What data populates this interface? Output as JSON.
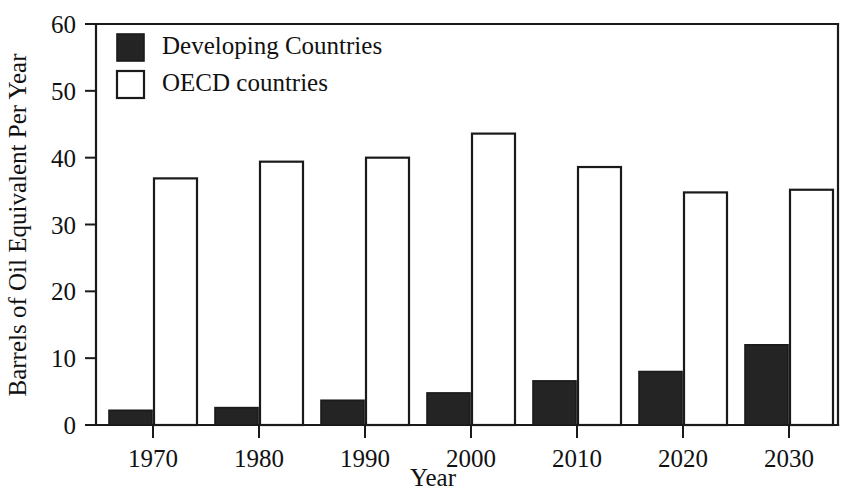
{
  "chart_data": {
    "type": "bar",
    "title": "",
    "xlabel": "Year",
    "ylabel": "Barrels of Oil Equivalent Per Year",
    "categories": [
      "1970",
      "1980",
      "1990",
      "2000",
      "2010",
      "2020",
      "2030"
    ],
    "series": [
      {
        "name": "Developing Countries",
        "color": "#242424",
        "style": "filled",
        "values": [
          2.2,
          2.6,
          3.7,
          4.8,
          6.6,
          8.0,
          12.0
        ]
      },
      {
        "name": "OECD countries",
        "color": "#ffffff",
        "style": "outlined",
        "values": [
          36.9,
          39.4,
          40.0,
          43.6,
          38.6,
          34.8,
          35.2
        ]
      }
    ],
    "ylim": [
      0,
      60
    ],
    "yticks": [
      0,
      10,
      20,
      30,
      40,
      50,
      60
    ],
    "ytick_labels": [
      "0",
      "10",
      "20",
      "30",
      "40",
      "50",
      "60"
    ],
    "xtick_labels": [
      "1970",
      "1980",
      "1990",
      "2000",
      "2010",
      "2020",
      "2030"
    ],
    "grid": false,
    "legend_position": "top-left",
    "frame": "left-top-bottom"
  },
  "legend": {
    "entries": [
      {
        "label": "Developing Countries",
        "swatch": "dark"
      },
      {
        "label": "OECD countries",
        "swatch": "light"
      }
    ]
  },
  "axes": {
    "y_title": "Barrels of Oil Equivalent Per Year",
    "x_title": "Year"
  }
}
